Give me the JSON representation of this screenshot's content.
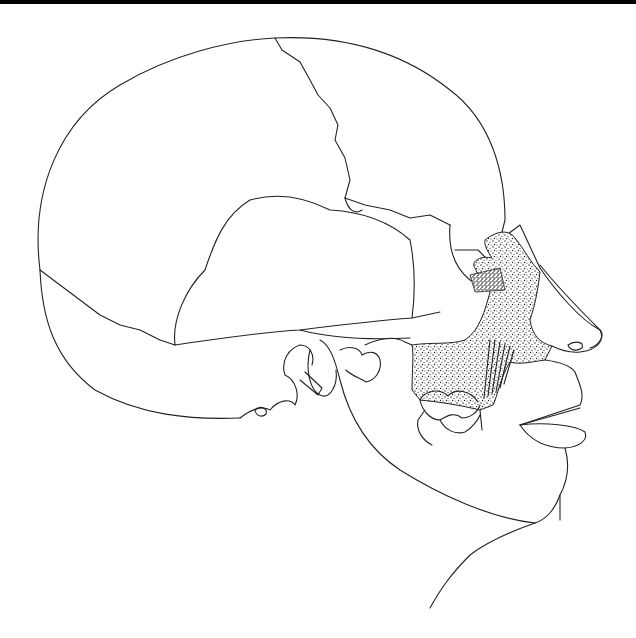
{
  "figure": {
    "colors": {
      "line": "#222222",
      "background": "#ffffff",
      "stipple": "#1a1a1a",
      "top_border": "#000000"
    }
  }
}
